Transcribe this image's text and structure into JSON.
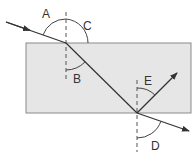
{
  "diagram": {
    "colors": {
      "block_fill": "#e6e6e6",
      "block_stroke": "#8a8a8a",
      "ray": "#333333",
      "normal": "#555555",
      "arc": "#444444"
    },
    "labels": {
      "A": "A",
      "B": "B",
      "C": "C",
      "D": "D",
      "E": "E"
    },
    "elements": [
      {
        "id": "block",
        "type": "glass-block"
      },
      {
        "id": "incident-ray",
        "type": "ray",
        "arrow": true
      },
      {
        "id": "refracted-ray",
        "type": "ray"
      },
      {
        "id": "emergent-ray",
        "type": "ray",
        "arrow": true
      },
      {
        "id": "reflected-ray",
        "type": "ray",
        "arrow": true
      },
      {
        "id": "normal-top",
        "type": "dashed-normal"
      },
      {
        "id": "normal-bottom",
        "type": "dashed-normal"
      }
    ]
  }
}
